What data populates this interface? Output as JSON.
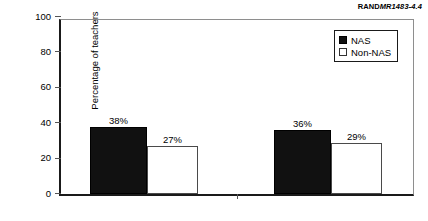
{
  "source_credit": {
    "mark": "RAND",
    "document": "MR1483-4.4"
  },
  "legend": {
    "position": "top-right",
    "entries": [
      {
        "label": "NAS",
        "color": "#111111",
        "swatch": "filled-square-icon"
      },
      {
        "label": "Non-NAS",
        "color": "#ffffff",
        "swatch": "outlined-square-icon"
      }
    ]
  },
  "chart_data": {
    "type": "bar",
    "title": "",
    "subtitle": "",
    "xlabel": "",
    "ylabel": "Percentage of teachers",
    "ylim": [
      0,
      100
    ],
    "yticks": [
      0,
      20,
      40,
      60,
      80,
      100
    ],
    "ytick_labels": [
      "0",
      "20",
      "40",
      "60",
      "80",
      "100"
    ],
    "grid": false,
    "categories": [
      "1998",
      "1999"
    ],
    "series": [
      {
        "name": "NAS",
        "color": "#111111",
        "values": [
          38,
          36
        ],
        "labels": [
          "38%",
          "36%"
        ]
      },
      {
        "name": "Non-NAS",
        "color": "#ffffff",
        "values": [
          27,
          29
        ],
        "labels": [
          "27%",
          "29%"
        ]
      }
    ]
  }
}
